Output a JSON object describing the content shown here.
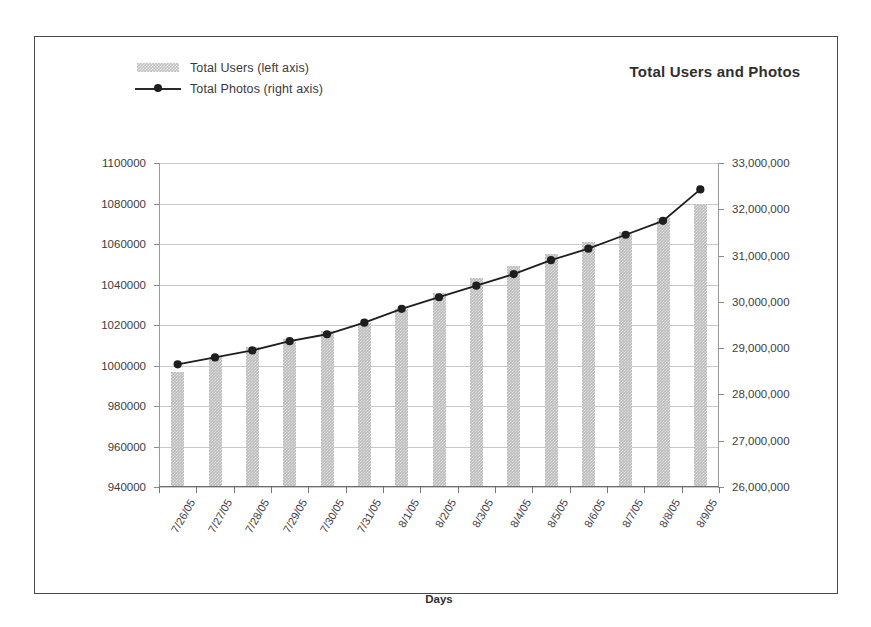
{
  "chart_data": {
    "type": "bar",
    "title": "Total Users and Photos",
    "xlabel": "Days",
    "ylabel": "",
    "grid": true,
    "legend_position": "top-left",
    "categories": [
      "7/26/05",
      "7/27/05",
      "7/28/05",
      "7/29/05",
      "7/30/05",
      "7/31/05",
      "8/1/05",
      "8/2/05",
      "8/3/05",
      "8/4/05",
      "8/5/05",
      "8/6/05",
      "8/7/05",
      "8/8/05",
      "8/9/05"
    ],
    "series": [
      {
        "name": "Total Users (left axis)",
        "type": "bar",
        "axis": "left",
        "color": "#b9b9b9",
        "values": [
          997000,
          1004000,
          1009000,
          1013000,
          1017000,
          1021000,
          1028000,
          1036000,
          1043000,
          1049000,
          1055000,
          1061000,
          1066000,
          1073000,
          1080000
        ]
      },
      {
        "name": "Total Photos (right axis)",
        "type": "line",
        "axis": "right",
        "color": "#1e1e1e",
        "values": [
          28650000,
          28800000,
          28950000,
          29150000,
          29300000,
          29550000,
          29850000,
          30100000,
          30350000,
          30600000,
          30900000,
          31150000,
          31450000,
          31750000,
          32430000
        ]
      }
    ],
    "left_axis": {
      "min": 940000,
      "max": 1100000,
      "step": 20000,
      "ticks": [
        "940000",
        "960000",
        "980000",
        "1000000",
        "1020000",
        "1040000",
        "1060000",
        "1080000",
        "1100000"
      ]
    },
    "right_axis": {
      "min": 26000000,
      "max": 33000000,
      "step": 1000000,
      "ticks": [
        "26,000,000",
        "27,000,000",
        "28,000,000",
        "29,000,000",
        "30,000,000",
        "31,000,000",
        "32,000,000",
        "33,000,000"
      ]
    }
  },
  "legend": {
    "items": [
      {
        "label": "Total Users (left axis)",
        "key": "bar-swatch"
      },
      {
        "label": "Total Photos (right axis)",
        "key": "line-marker"
      }
    ]
  }
}
